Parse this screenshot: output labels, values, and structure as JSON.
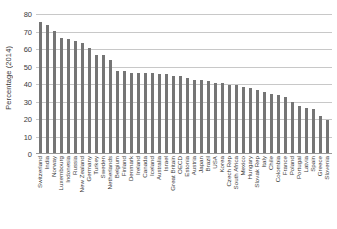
{
  "chart_data": {
    "type": "bar",
    "title": "",
    "xlabel": "",
    "ylabel": "Percentage (2014)",
    "ylim": [
      0,
      80
    ],
    "yticks": [
      0,
      10,
      20,
      30,
      40,
      50,
      60,
      70,
      80
    ],
    "grid": true,
    "legend": false,
    "bar_color": "#757575",
    "categories": [
      "Switzerland",
      "India",
      "Norway",
      "Luxembourg",
      "Indonesia",
      "Russia",
      "New Zealand",
      "Germany",
      "Turkey",
      "Sweden",
      "Netherlands",
      "Belgium",
      "Finland",
      "Denmark",
      "Ireland",
      "Canada",
      "Iceland",
      "Australia",
      "Israel",
      "Great Britain",
      "OECD",
      "Estonia",
      "Austria",
      "Japan",
      "Brazil",
      "USA",
      "Korea",
      "Czech Rep",
      "South Africa",
      "Mexico",
      "Hungary",
      "Slovak Rep",
      "Italy",
      "Chile",
      "Colombia",
      "France",
      "Poland",
      "Portugal",
      "Latvia",
      "Spain",
      "Greece",
      "Slovenia"
    ],
    "values": [
      75,
      73,
      70,
      66,
      65,
      64,
      63,
      60,
      56,
      56,
      53,
      47,
      47,
      46,
      46,
      46,
      46,
      45,
      45,
      44,
      44,
      43,
      42,
      42,
      41,
      40,
      40,
      39,
      39,
      38,
      37,
      36,
      35,
      34,
      33,
      32,
      29,
      27,
      26,
      25,
      21,
      19
    ]
  }
}
